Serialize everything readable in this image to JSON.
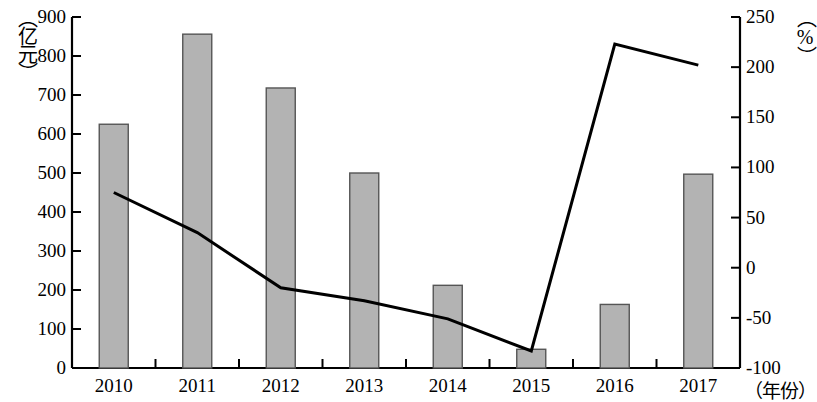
{
  "chart_data": {
    "type": "bar",
    "title": "",
    "subtitle": "",
    "categories": [
      "2010",
      "2011",
      "2012",
      "2013",
      "2014",
      "2015",
      "2016",
      "2017"
    ],
    "xlabel": "（年份）",
    "series": [
      {
        "name": "金额",
        "type": "bar",
        "axis": "left",
        "unit": "亿元",
        "values": [
          625,
          856,
          718,
          500,
          212,
          48,
          163,
          497
        ],
        "color": "#b3b3b3",
        "edge_color": "#555555"
      },
      {
        "name": "增长率",
        "type": "line",
        "axis": "right",
        "unit": "%",
        "values": [
          75,
          35,
          -20,
          -33,
          -51,
          -83,
          223,
          202
        ],
        "color": "#000000"
      }
    ],
    "left_axis": {
      "label": "（亿元）",
      "ylim": [
        0,
        900
      ],
      "ticks": [
        0,
        100,
        200,
        300,
        400,
        500,
        600,
        700,
        800,
        900
      ],
      "tick_labels": [
        "0",
        "100",
        "200",
        "300",
        "400",
        "500",
        "600",
        "700",
        "800",
        "900"
      ]
    },
    "right_axis": {
      "label": "（%）",
      "ylim": [
        -100,
        250
      ],
      "ticks": [
        -100,
        -50,
        0,
        50,
        100,
        150,
        200,
        250
      ],
      "tick_labels": [
        "-100",
        "-50",
        "0",
        "50",
        "100",
        "150",
        "200",
        "250"
      ]
    },
    "grid": false,
    "legend": null
  },
  "axis_labels": {
    "left_unit": "（亿元）",
    "right_unit": "（%）",
    "x_unit": "（年份）"
  }
}
